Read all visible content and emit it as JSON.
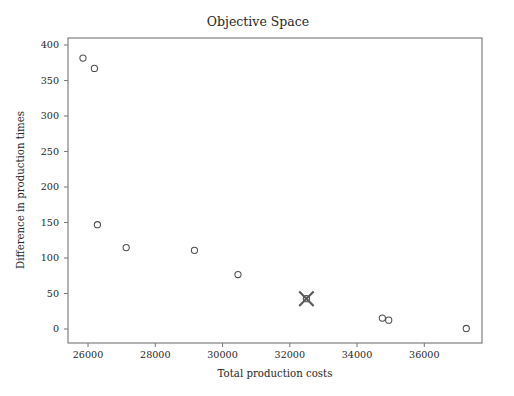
{
  "chart_data": {
    "type": "scatter",
    "title": "Objective Space",
    "xlabel": "Total production costs",
    "ylabel": "Difference in production times",
    "xlim": [
      25480,
      37640
    ],
    "ylim": [
      -20,
      421
    ],
    "grid": false,
    "legend": "none",
    "xticks": [
      26000,
      28000,
      30000,
      32000,
      34000,
      36000
    ],
    "xtick_labels": [
      "26000",
      "28000",
      "30000",
      "32000",
      "34000",
      "36000"
    ],
    "yticks": [
      0,
      50,
      100,
      150,
      200,
      250,
      300,
      350,
      400
    ],
    "ytick_labels": [
      "0",
      "50",
      "100",
      "150",
      "200",
      "250",
      "300",
      "350",
      "400"
    ],
    "series": [
      {
        "name": "solutions",
        "marker": "circle-open",
        "color": "#4d4d4d",
        "points": [
          {
            "x": 25920,
            "y": 392
          },
          {
            "x": 26256,
            "y": 377
          },
          {
            "x": 26344,
            "y": 151
          },
          {
            "x": 27189,
            "y": 118
          },
          {
            "x": 29194,
            "y": 114
          },
          {
            "x": 30473,
            "y": 79
          },
          {
            "x": 32483,
            "y": 44
          },
          {
            "x": 34713,
            "y": 16
          },
          {
            "x": 34900,
            "y": 13
          },
          {
            "x": 37178,
            "y": 1
          }
        ]
      },
      {
        "name": "selected solution",
        "marker": "x",
        "color": "#595959",
        "points": [
          {
            "x": 32483,
            "y": 44
          }
        ]
      }
    ]
  },
  "figure": {
    "background_color": "#ffffff",
    "axes_color": "#7a7a7a",
    "text_color": "#262626",
    "plot_area": {
      "left": 68,
      "right": 482,
      "top": 38,
      "bottom": 343
    }
  }
}
